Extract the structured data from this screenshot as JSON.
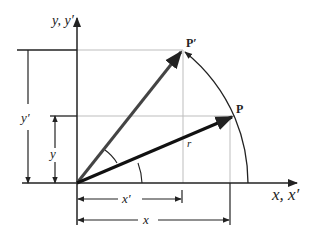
{
  "diagram": {
    "axes": {
      "y_label": "y, y′",
      "x_label": "x, x′"
    },
    "points": {
      "p_label": "P",
      "p_prime_label": "P′"
    },
    "radius_label": "r",
    "dimensions": {
      "y_label": "y",
      "y_prime_label": "y′",
      "x_label": "x",
      "x_prime_label": "x′"
    },
    "colors": {
      "vector_p": "#111111",
      "vector_p_prime": "#444444",
      "axis": "#222222",
      "guide": "#bbbbbb"
    }
  }
}
